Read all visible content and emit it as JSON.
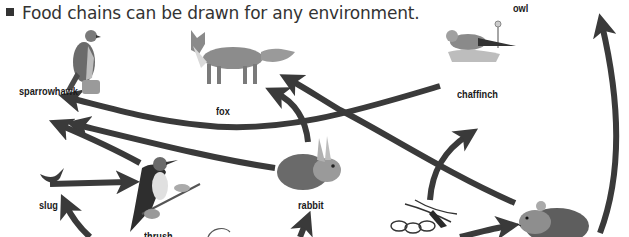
{
  "heading": {
    "text": "Food chains can be drawn for any environment."
  },
  "organisms": {
    "owl": "owl",
    "sparrowhawk": "sparrowhawk",
    "fox": "fox",
    "chaffinch": "chaffinch",
    "slug": "slug",
    "thrush": "thrush",
    "rabbit": "rabbit",
    "mouse": "",
    "seeds": "",
    "plant": ""
  },
  "arrows": [
    {
      "from": "rabbit",
      "to": "fox"
    },
    {
      "from": "mouse",
      "to": "fox"
    },
    {
      "from": "chaffinch",
      "to": "sparrowhawk"
    },
    {
      "from": "rabbit",
      "to": "sparrowhawk"
    },
    {
      "from": "thrush",
      "to": "sparrowhawk"
    },
    {
      "from": "slug",
      "to": "thrush"
    },
    {
      "from": "seeds",
      "to": "chaffinch"
    },
    {
      "from": "seeds",
      "to": "mouse"
    },
    {
      "from": "mouse",
      "to": "owl"
    },
    {
      "from": "plant",
      "to": "slug"
    },
    {
      "from": "plant",
      "to": "rabbit"
    }
  ],
  "colors": {
    "arrow": "#3a3a3a",
    "text": "#1a1a1a",
    "background": "#ffffff"
  }
}
